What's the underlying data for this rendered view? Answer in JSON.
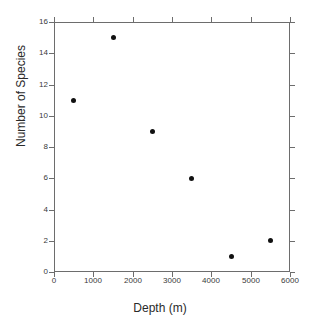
{
  "chart_data": {
    "type": "scatter",
    "title": "",
    "xlabel": "Depth (m)",
    "ylabel": "Number of Species",
    "xlim": [
      0,
      6000
    ],
    "ylim": [
      0,
      16
    ],
    "xticks": [
      0,
      1000,
      2000,
      3000,
      4000,
      5000,
      6000
    ],
    "yticks": [
      0,
      2,
      4,
      6,
      8,
      10,
      12,
      14,
      16
    ],
    "xtick_labels": [
      "0",
      "1000",
      "2000",
      "3000",
      "4000",
      "5000",
      "6000"
    ],
    "ytick_labels": [
      "0",
      "2",
      "4",
      "6",
      "8",
      "10",
      "12",
      "14",
      "16"
    ],
    "grid": false,
    "legend": false,
    "marker_color": "#111111",
    "marker_shape": "filled-circle",
    "axis_color": "#6d6d6d",
    "background": "#ffffff",
    "series": [
      {
        "name": "",
        "x": [
          500,
          1500,
          2500,
          3500,
          4500,
          5500
        ],
        "y": [
          11,
          15,
          9,
          6,
          1,
          2
        ]
      }
    ],
    "points": [
      {
        "x": 500,
        "y": 11
      },
      {
        "x": 1500,
        "y": 15
      },
      {
        "x": 2500,
        "y": 9
      },
      {
        "x": 3500,
        "y": 6
      },
      {
        "x": 4500,
        "y": 1
      },
      {
        "x": 5500,
        "y": 2
      }
    ]
  }
}
